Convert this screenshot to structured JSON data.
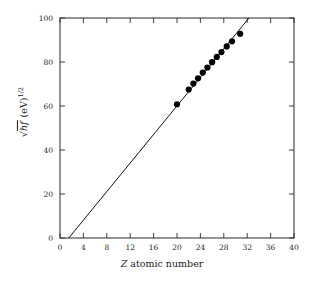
{
  "chart_data": {
    "type": "scatter",
    "title": "",
    "xlabel": "Z atomic number",
    "ylabel": "√hf (eV)^1/2",
    "xlabel_parts": {
      "symbol": "Z",
      "rest": " atomic number"
    },
    "ylabel_parts": {
      "radical": "hf",
      "units": " (eV)",
      "exponent": "1/2"
    },
    "xlim": [
      0,
      40
    ],
    "ylim": [
      0,
      100
    ],
    "xticks": [
      0,
      4,
      8,
      12,
      16,
      20,
      24,
      28,
      32,
      36,
      40
    ],
    "xtick_labels": [
      "0",
      "4",
      "8",
      "12",
      "16",
      "20",
      "24",
      "28",
      "32",
      "36",
      "40"
    ],
    "yticks": [
      0,
      20,
      40,
      60,
      80,
      100
    ],
    "ytick_labels": [
      "0",
      "20",
      "40",
      "60",
      "80",
      "100"
    ],
    "grid": false,
    "legend": "none",
    "frame": "box-all-sides-inward-ticks",
    "x": [
      20.0,
      22.0,
      22.8,
      23.6,
      24.4,
      25.2,
      26.0,
      26.8,
      27.6,
      28.5,
      29.4,
      30.8
    ],
    "y": [
      60.8,
      67.5,
      70.2,
      72.6,
      75.2,
      77.5,
      79.9,
      82.3,
      84.5,
      87.1,
      89.4,
      92.8
    ],
    "series": [
      {
        "name": "K-alpha X-ray data",
        "marker": "filled-circle",
        "x": [
          20.0,
          22.0,
          22.8,
          23.6,
          24.4,
          25.2,
          26.0,
          26.8,
          27.6,
          28.5,
          29.4,
          30.8
        ],
        "y": [
          60.8,
          67.5,
          70.2,
          72.6,
          75.2,
          77.5,
          79.9,
          82.3,
          84.5,
          87.1,
          89.4,
          92.8
        ]
      }
    ],
    "fit_line": {
      "name": "Moseley straight-line fit",
      "x_start": 1.5,
      "y_start": 0,
      "x_end": 32.3,
      "y_end": 100,
      "slope": 3.25,
      "intercept": -4.87
    },
    "colors": {
      "marker": "#000000",
      "line": "#111111",
      "axis": "#2b2b2b",
      "background": "#ffffff"
    }
  }
}
